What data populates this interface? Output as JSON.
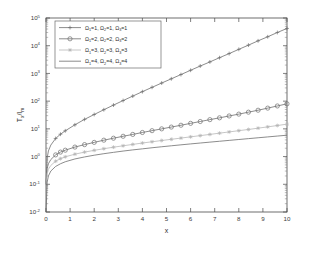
{
  "chart_data": {
    "type": "line",
    "title": "",
    "xlabel": "x",
    "ylabel": "T_x/I_m",
    "ylabel_main": "T",
    "ylabel_sub1": "x",
    "ylabel_mid": "/I",
    "ylabel_sub2": "m",
    "xlim": [
      0,
      10
    ],
    "ylim": [
      0.01,
      100000
    ],
    "yscale": "log",
    "xscale": "linear",
    "grid": false,
    "legend_position": "upper left",
    "x_ticks": [
      "0",
      "1",
      "2",
      "3",
      "4",
      "5",
      "6",
      "7",
      "8",
      "9",
      "10"
    ],
    "x_tick_values": [
      0,
      1,
      2,
      3,
      4,
      5,
      6,
      7,
      8,
      9,
      10
    ],
    "y_ticks": [
      "10-2",
      "10-1",
      "100",
      "101",
      "102",
      "103",
      "104",
      "105"
    ],
    "y_tick_mantissa": "10",
    "y_tick_exponents": [
      "-2",
      "-1",
      "0",
      "1",
      "2",
      "3",
      "4",
      "5"
    ],
    "y_tick_values": [
      0.01,
      0.1,
      1,
      10,
      100,
      1000,
      10000,
      100000
    ],
    "x": [
      0,
      0.05,
      0.1,
      0.2,
      0.4,
      0.6,
      0.8,
      1.2,
      1.6,
      2.0,
      2.4,
      2.8,
      3.2,
      3.6,
      4.0,
      4.4,
      4.8,
      5.2,
      5.6,
      6.0,
      6.4,
      6.8,
      7.2,
      7.6,
      8.0,
      8.4,
      8.8,
      9.2,
      9.6,
      10
    ],
    "series": [
      {
        "name": "O1=1, O2=1, O3=1",
        "label_parts": [
          "1",
          "1",
          "1"
        ],
        "marker": "plus",
        "color": "#6e6e6e",
        "values": [
          0.1,
          0.9,
          1.6,
          2.6,
          4.5,
          6.4,
          8.5,
          14,
          22,
          33,
          49,
          72,
          105,
          152,
          220,
          315,
          450,
          640,
          910,
          1300,
          1850,
          2600,
          3700,
          5200,
          7400,
          10500,
          15000,
          21000,
          30000,
          42000
        ]
      },
      {
        "name": "O2=2, O2=2, O3=2",
        "label_parts": [
          "2",
          "2",
          "2"
        ],
        "marker": "circle",
        "color": "#6e6e6e",
        "values": [
          0.1,
          0.38,
          0.55,
          0.78,
          1.15,
          1.45,
          1.7,
          2.2,
          2.7,
          3.25,
          3.9,
          4.6,
          5.4,
          6.3,
          7.4,
          8.6,
          10.0,
          11.6,
          13.5,
          15.8,
          18.4,
          21.5,
          25.0,
          29.2,
          34.0,
          40.0,
          47.0,
          56.0,
          67.0,
          80.0
        ]
      },
      {
        "name": "O1=3, O2=3, O3=3",
        "label_parts": [
          "3",
          "3",
          "3"
        ],
        "marker": "star",
        "color": "#b8b8b8",
        "values": [
          0.1,
          0.25,
          0.35,
          0.48,
          0.68,
          0.84,
          0.98,
          1.22,
          1.45,
          1.68,
          1.92,
          2.18,
          2.45,
          2.75,
          3.08,
          3.42,
          3.8,
          4.2,
          4.65,
          5.15,
          5.7,
          6.3,
          7.0,
          7.75,
          8.6,
          9.5,
          10.6,
          11.8,
          13.2,
          14.8
        ]
      },
      {
        "name": "O1=4, O2=4, O3=4",
        "label_parts": [
          "4",
          "4",
          "4"
        ],
        "marker": "none",
        "color": "#6e6e6e",
        "values": [
          0.01,
          0.12,
          0.2,
          0.3,
          0.44,
          0.55,
          0.65,
          0.82,
          0.97,
          1.12,
          1.27,
          1.42,
          1.58,
          1.74,
          1.9,
          2.08,
          2.26,
          2.45,
          2.65,
          2.86,
          3.08,
          3.32,
          3.57,
          3.84,
          4.13,
          4.44,
          4.77,
          5.12,
          5.5,
          5.9
        ]
      }
    ],
    "legend_entries": [
      {
        "marker": "plus",
        "omega1": "1",
        "omega2": "1",
        "omega3": "1",
        "symbol": "Ω"
      },
      {
        "marker": "circle",
        "omega1": "2",
        "omega2": "2",
        "omega3": "2",
        "symbol": "Ω"
      },
      {
        "marker": "star",
        "omega1": "3",
        "omega2": "3",
        "omega3": "3",
        "symbol": "Ω"
      },
      {
        "marker": "none",
        "omega1": "4",
        "omega2": "4",
        "omega3": "4",
        "symbol": "Ω"
      }
    ],
    "legend_equals": "=",
    "legend_comma": ","
  }
}
